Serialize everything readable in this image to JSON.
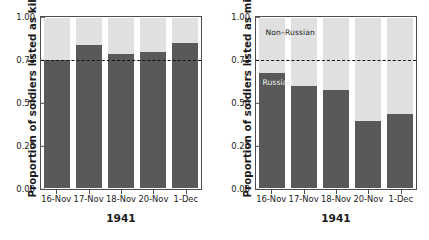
{
  "chart_data": [
    {
      "panel": "left",
      "type": "bar",
      "subtype": "stacked-proportion",
      "title": "",
      "xlabel": "1941",
      "ylabel": "Proportion of soldiers listed as killed",
      "categories": [
        "16-Nov",
        "17-Nov",
        "18-Nov",
        "20-Nov",
        "1-Dec"
      ],
      "ylim": [
        0,
        1
      ],
      "yticks": [
        "0.00",
        "0.25",
        "0.50",
        "0.75",
        "1.00"
      ],
      "ytick_values": [
        0.0,
        0.25,
        0.5,
        0.75,
        1.0
      ],
      "grid": false,
      "legend": "none",
      "reference_line": {
        "value": 0.75,
        "style": "dashed",
        "color": "#111111"
      },
      "series": [
        {
          "name": "Russian",
          "color": "#595959",
          "values": [
            0.755,
            0.84,
            0.79,
            0.8,
            0.855
          ]
        },
        {
          "name": "Non-Russian",
          "color": "#e0e0e0",
          "values": [
            0.245,
            0.16,
            0.21,
            0.2,
            0.145
          ]
        }
      ],
      "annotations": []
    },
    {
      "panel": "right",
      "type": "bar",
      "subtype": "stacked-proportion",
      "title": "",
      "xlabel": "1941",
      "ylabel": "Proportion of soldiers listed as missing",
      "categories": [
        "16-Nov",
        "17-Nov",
        "18-Nov",
        "20-Nov",
        "1-Dec"
      ],
      "ylim": [
        0,
        1
      ],
      "yticks": [
        "0.00",
        "0.25",
        "0.50",
        "0.75",
        "1.00"
      ],
      "ytick_values": [
        0.0,
        0.25,
        0.5,
        0.75,
        1.0
      ],
      "grid": false,
      "legend": "in-plot labels",
      "reference_line": {
        "value": 0.75,
        "style": "dashed",
        "color": "#111111"
      },
      "series": [
        {
          "name": "Russian",
          "color": "#595959",
          "values": [
            0.675,
            0.6,
            0.575,
            0.395,
            0.435
          ]
        },
        {
          "name": "Non-Russian",
          "color": "#e0e0e0",
          "values": [
            0.325,
            0.4,
            0.425,
            0.605,
            0.565
          ]
        }
      ],
      "annotations": [
        {
          "text": "Non–Russian",
          "x": 0.06,
          "y": 0.935,
          "color": "#1a1a1a"
        },
        {
          "text": "Russian",
          "x": 0.04,
          "y": 0.645,
          "color": "#f2f2f2"
        }
      ]
    }
  ],
  "colors": {
    "russian": "#595959",
    "non_russian": "#e0e0e0",
    "axis": "#4d4d4d",
    "reference_line": "#111111",
    "background": "#ffffff"
  }
}
